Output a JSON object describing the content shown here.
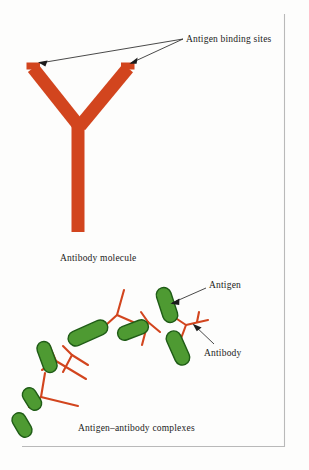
{
  "figure": {
    "background_color": "#fdfdfc",
    "border_color": "#b9b9b9",
    "antibody_color": "#d2451e",
    "antigen_fill_color": "#4e9a32",
    "antigen_stroke_color": "#1f5c16",
    "leader_color": "#1c1c1c"
  },
  "labels": {
    "antigen_binding_sites": "Antigen binding sites",
    "antigen": "Antigen",
    "antibody": "Antibody"
  },
  "captions": {
    "top": "Antibody molecule",
    "bottom": "Antigen–antibody complexes"
  },
  "diagram_data": {
    "type": "diagram",
    "subject": "immunology schematic",
    "panels": [
      {
        "name": "antibody-molecule",
        "caption": "Antibody molecule",
        "shape": "Y",
        "color": "#d2451e",
        "annotated_parts": [
          "Antigen binding sites"
        ],
        "arm_tips": [
          [
            36,
            66
          ],
          [
            126,
            66
          ]
        ],
        "hinge": [
          80,
          128
        ],
        "stem_end": [
          78,
          232
        ]
      },
      {
        "name": "antigen-antibody-complexes",
        "caption": "Antigen–antibody complexes",
        "antigen_count": 7,
        "antibody_count": 5,
        "annotated_parts": [
          "Antigen",
          "Antibody"
        ],
        "antigen_color": "#4e9a32",
        "antibody_color": "#d2451e"
      }
    ]
  }
}
